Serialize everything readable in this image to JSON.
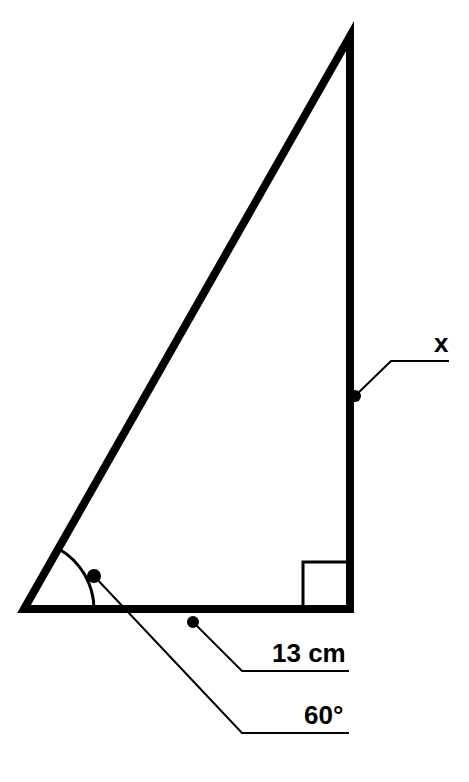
{
  "figure": {
    "type": "geometry-diagram",
    "background_color": "#ffffff",
    "stroke_color": "#000000",
    "width": 469,
    "height": 782
  },
  "shape": {
    "name": "right-triangle",
    "vertices": {
      "bottom_left": {
        "x": 24,
        "y": 609
      },
      "bottom_right": {
        "x": 350,
        "y": 609
      },
      "apex": {
        "x": 350,
        "y": 36
      }
    },
    "stroke_width": 8
  },
  "right_angle_marker": {
    "name": "right-angle-square",
    "x": 303,
    "y": 562,
    "size": 45,
    "stroke_width": 3,
    "at_vertex": "bottom_right"
  },
  "angle_arc": {
    "name": "angle-arc-60",
    "center": {
      "x": 24,
      "y": 609
    },
    "radius": 70,
    "start": {
      "x": 59,
      "y": 549
    },
    "end": {
      "x": 94,
      "y": 609
    },
    "stroke_width": 3
  },
  "labels": {
    "side_x": {
      "text": "x",
      "name": "label-x",
      "text_x": 434,
      "text_y": 352,
      "font_size": 26,
      "leader": {
        "dot": {
          "x": 355,
          "y": 396,
          "r": 6
        },
        "bend": {
          "x": 391,
          "y": 361
        },
        "end": {
          "x": 449,
          "y": 361
        },
        "stroke_width": 2
      },
      "refers_to": "vertical-side"
    },
    "side_length": {
      "text": "13 cm",
      "name": "label-13-cm",
      "text_x": 272,
      "text_y": 662,
      "font_size": 26,
      "leader": {
        "dot": {
          "x": 193,
          "y": 622,
          "r": 6
        },
        "bend": {
          "x": 242,
          "y": 671
        },
        "end": {
          "x": 349,
          "y": 671
        },
        "stroke_width": 2
      },
      "refers_to": "base-side"
    },
    "angle_measure": {
      "text": "60°",
      "name": "label-60-degrees",
      "text_x": 304,
      "text_y": 724,
      "font_size": 26,
      "leader": {
        "dot": {
          "x": 94,
          "y": 576,
          "r": 7
        },
        "bend": {
          "x": 242,
          "y": 733
        },
        "end": {
          "x": 349,
          "y": 733
        },
        "stroke_width": 2
      },
      "refers_to": "bottom-left-angle"
    }
  }
}
